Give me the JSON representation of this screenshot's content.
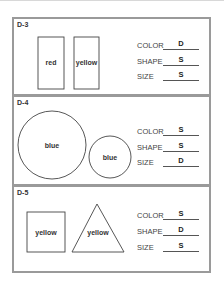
{
  "panels": [
    {
      "id": "D-3",
      "shapes": [
        {
          "type": "rectangle",
          "label": "red"
        },
        {
          "type": "rectangle",
          "label": "yellow"
        }
      ],
      "attributes": [
        {
          "label": "COLOR",
          "value": "D"
        },
        {
          "label": "SHAPE",
          "value": "S"
        },
        {
          "label": "SIZE",
          "value": "S"
        }
      ]
    },
    {
      "id": "D-4",
      "shapes": [
        {
          "type": "circle-large",
          "label": "blue"
        },
        {
          "type": "circle-small",
          "label": "blue"
        }
      ],
      "attributes": [
        {
          "label": "COLOR",
          "value": "S"
        },
        {
          "label": "SHAPE",
          "value": "S"
        },
        {
          "label": "SIZE",
          "value": "D"
        }
      ]
    },
    {
      "id": "D-5",
      "shapes": [
        {
          "type": "square",
          "label": "yellow"
        },
        {
          "type": "triangle",
          "label": "yellow"
        }
      ],
      "attributes": [
        {
          "label": "COLOR",
          "value": "S"
        },
        {
          "label": "SHAPE",
          "value": "D"
        },
        {
          "label": "SIZE",
          "value": "S"
        }
      ]
    }
  ]
}
